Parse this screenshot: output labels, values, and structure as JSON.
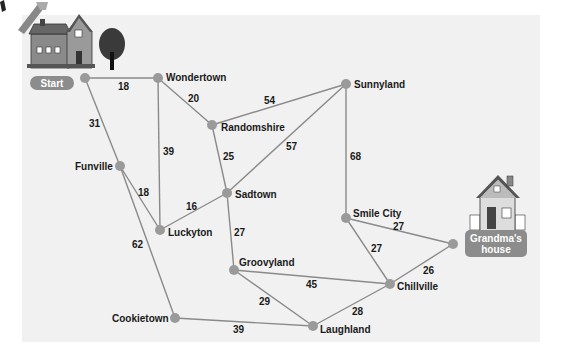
{
  "colors": {
    "panel": "#f1f1f1",
    "edge": "#8a8a8a",
    "node": "#9a9a9a",
    "label_pill": "#8c8c8c",
    "text": "#1a1a1a"
  },
  "start_label": "Start",
  "end_label_line1": "Grandma's",
  "end_label_line2": "house",
  "nodes": [
    {
      "id": "start",
      "label": "",
      "x": 85,
      "y": 78
    },
    {
      "id": "wondertown",
      "label": "Wondertown",
      "x": 158,
      "y": 78
    },
    {
      "id": "funville",
      "label": "Funville",
      "x": 120,
      "y": 166
    },
    {
      "id": "randomshire",
      "label": "Randomshire",
      "x": 212,
      "y": 125
    },
    {
      "id": "sunnyland",
      "label": "Sunnyland",
      "x": 346,
      "y": 84
    },
    {
      "id": "luckyton",
      "label": "Luckyton",
      "x": 160,
      "y": 230
    },
    {
      "id": "sadtown",
      "label": "Sadtown",
      "x": 227,
      "y": 193
    },
    {
      "id": "smilecity",
      "label": "Smile City",
      "x": 346,
      "y": 218
    },
    {
      "id": "groovyland",
      "label": "Groovyland",
      "x": 234,
      "y": 270
    },
    {
      "id": "chillville",
      "label": "Chillville",
      "x": 390,
      "y": 284
    },
    {
      "id": "cookietown",
      "label": "Cookietown",
      "x": 175,
      "y": 318
    },
    {
      "id": "laughland",
      "label": "Laughland",
      "x": 313,
      "y": 326
    },
    {
      "id": "grandma",
      "label": "",
      "x": 453,
      "y": 244
    }
  ],
  "edges": [
    {
      "from": "start",
      "to": "wondertown",
      "weight": "18"
    },
    {
      "from": "start",
      "to": "funville",
      "weight": "31"
    },
    {
      "from": "wondertown",
      "to": "randomshire",
      "weight": "20"
    },
    {
      "from": "wondertown",
      "to": "luckyton",
      "weight": "39"
    },
    {
      "from": "randomshire",
      "to": "sunnyland",
      "weight": "54"
    },
    {
      "from": "randomshire",
      "to": "sadtown",
      "weight": "25"
    },
    {
      "from": "sunnyland",
      "to": "sadtown",
      "weight": "57"
    },
    {
      "from": "sunnyland",
      "to": "smilecity",
      "weight": "68"
    },
    {
      "from": "funville",
      "to": "luckyton",
      "weight": "18"
    },
    {
      "from": "funville",
      "to": "cookietown",
      "weight": "62"
    },
    {
      "from": "luckyton",
      "to": "sadtown",
      "weight": "16"
    },
    {
      "from": "sadtown",
      "to": "groovyland",
      "weight": "27"
    },
    {
      "from": "smilecity",
      "to": "grandma",
      "weight": "27"
    },
    {
      "from": "smilecity",
      "to": "chillville",
      "weight": "27"
    },
    {
      "from": "chillville",
      "to": "grandma",
      "weight": "26"
    },
    {
      "from": "groovyland",
      "to": "chillville",
      "weight": "45"
    },
    {
      "from": "groovyland",
      "to": "laughland",
      "weight": "29"
    },
    {
      "from": "laughland",
      "to": "chillville",
      "weight": "28"
    },
    {
      "from": "cookietown",
      "to": "laughland",
      "weight": "39"
    }
  ],
  "labels": {
    "wondertown": "Wondertown",
    "funville": "Funville",
    "randomshire": "Randomshire",
    "sunnyland": "Sunnyland",
    "luckyton": "Luckyton",
    "sadtown": "Sadtown",
    "smilecity": "Smile City",
    "groovyland": "Groovyland",
    "chillville": "Chillville",
    "cookietown": "Cookietown",
    "laughland": "Laughland"
  },
  "weights": {
    "start_wondertown": "18",
    "start_funville": "31",
    "wondertown_randomshire": "20",
    "wondertown_luckyton": "39",
    "randomshire_sunnyland": "54",
    "randomshire_sadtown": "25",
    "sunnyland_sadtown": "57",
    "sunnyland_smilecity": "68",
    "funville_luckyton": "18",
    "funville_cookietown": "62",
    "luckyton_sadtown": "16",
    "sadtown_groovyland": "27",
    "smilecity_grandma": "27",
    "smilecity_chillville": "27",
    "chillville_grandma": "26",
    "groovyland_chillville": "45",
    "groovyland_laughland": "29",
    "laughland_chillville": "28",
    "cookietown_laughland": "39"
  }
}
